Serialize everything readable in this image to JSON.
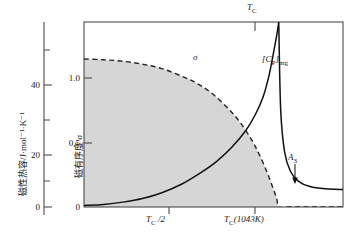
{
  "chart_data": {
    "type": "line",
    "title": "",
    "subtitle": "",
    "axis_left": {
      "label": "磁性热容/J·mol⁻¹·K⁻¹",
      "ticks": [
        0,
        20,
        40
      ],
      "tick_labels": [
        "0",
        "20",
        "40"
      ],
      "minor_ticks": [
        10,
        30,
        50
      ],
      "range": [
        0,
        57
      ]
    },
    "axis_right_inner": {
      "label": "磁有序度 σ",
      "ticks": [
        0,
        0.5,
        1.0
      ],
      "tick_labels": [
        "0",
        "0.5",
        "1.0"
      ],
      "range": [
        0,
        1.25
      ]
    },
    "axis_x": {
      "label": "",
      "tick_labels": [
        "T_C /2",
        "T_C(1043K)"
      ],
      "tick_positions": [
        "0.5",
        "1.0"
      ],
      "top_tick_label": "T_C",
      "range": [
        0,
        1.33
      ]
    },
    "series": [
      {
        "name": "磁有序度 σ",
        "annotation": "σ",
        "style": "dashed",
        "color": "#222222",
        "filled": true,
        "fill_color": "#d6d6d6",
        "x": [
          0.0,
          0.1,
          0.2,
          0.3,
          0.4,
          0.5,
          0.58,
          0.66,
          0.74,
          0.8,
          0.86,
          0.9,
          0.94,
          0.97,
          0.99,
          1.0,
          1.05,
          1.15,
          1.33
        ],
        "y": [
          1.0,
          0.995,
          0.985,
          0.965,
          0.935,
          0.885,
          0.835,
          0.765,
          0.665,
          0.575,
          0.455,
          0.355,
          0.235,
          0.13,
          0.055,
          0.0,
          0.0,
          0.0,
          0.0
        ]
      },
      {
        "name": "[C_P]mg",
        "annotation": "[C_P]_mg",
        "style": "solid",
        "color": "#111111",
        "x": [
          0.0,
          0.1,
          0.2,
          0.3,
          0.4,
          0.5,
          0.6,
          0.68,
          0.76,
          0.83,
          0.88,
          0.92,
          0.95,
          0.97,
          0.99,
          1.0,
          1.01,
          1.03,
          1.06,
          1.1,
          1.16,
          1.24,
          1.33
        ],
        "y": [
          0.5,
          0.8,
          1.5,
          2.6,
          4.4,
          7.0,
          10.6,
          14.0,
          18.5,
          23.5,
          28.5,
          34.0,
          40.5,
          46.5,
          53.0,
          57.0,
          30.0,
          17.0,
          11.0,
          8.0,
          6.3,
          5.6,
          5.4
        ]
      }
    ],
    "annotations": [
      {
        "id": "sigma-label",
        "text": "σ",
        "x": 0.395,
        "y": 0.93
      },
      {
        "id": "cp-label",
        "text": "[C_P]mg",
        "x": 1.03,
        "y": 0.8
      },
      {
        "id": "a3-label",
        "text": "A_3",
        "x": 1.12,
        "y": 0.29
      },
      {
        "id": "tc-top-label",
        "text": "T_C",
        "x": 1.0,
        "y": 1.08
      }
    ],
    "grid": false,
    "legend": "none",
    "fill_color": "#d6d6d6",
    "frame_color": "#4c4c4c"
  }
}
